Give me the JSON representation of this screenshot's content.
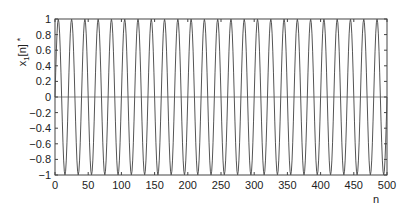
{
  "chart_data": {
    "type": "line",
    "title": "",
    "xlabel": "n",
    "ylabel": "x₁[n] *",
    "xlim": [
      0,
      500
    ],
    "ylim": [
      -1,
      1
    ],
    "xticks": [
      0,
      50,
      100,
      150,
      200,
      250,
      300,
      350,
      400,
      450,
      500
    ],
    "yticks": [
      1,
      0.8,
      0.6,
      0.4,
      0.2,
      0,
      -0.2,
      -0.4,
      -0.6,
      -0.8,
      -1
    ],
    "grid": false,
    "legend": null,
    "zero_line": true,
    "series": [
      {
        "name": "x1[n]",
        "function": "sin(2*pi*n/20)",
        "period": 20,
        "amplitude": 1,
        "n_start": 0,
        "n_end": 500,
        "color": "#555555"
      }
    ]
  },
  "labels": {
    "xlabel": "n",
    "ylabel_main": "x",
    "ylabel_sub": "1",
    "ylabel_rest": "[n]",
    "ylabel_mark": "*"
  }
}
